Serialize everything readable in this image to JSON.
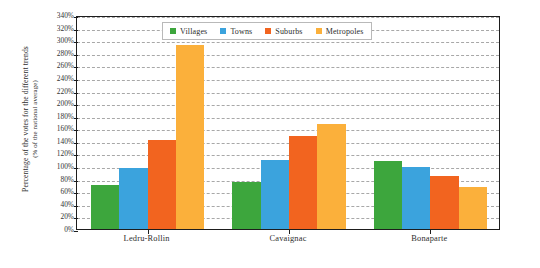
{
  "chart_data": {
    "type": "bar",
    "title": "",
    "subtitle": "",
    "xlabel": "",
    "ylabel": "Percentage of the votes for the different trends",
    "ylabel_line2": "(% of the national average)",
    "categories": [
      "Ledru-Rollin",
      "Cavaignac",
      "Bonaparte"
    ],
    "series": [
      {
        "name": "Villages",
        "color": "#3da63d",
        "values": [
          70,
          75,
          108
        ]
      },
      {
        "name": "Towns",
        "color": "#3ba3dd",
        "values": [
          97,
          110,
          98
        ]
      },
      {
        "name": "Suburbs",
        "color": "#f2641f",
        "values": [
          141,
          147,
          85
        ]
      },
      {
        "name": "Metropoles",
        "color": "#fbb03b",
        "values": [
          293,
          167,
          67
        ]
      }
    ],
    "ylim": [
      0,
      340
    ],
    "ytick_step": 20,
    "ytick_labels": [
      "340%",
      "320%",
      "300%",
      "280%",
      "260%",
      "240%",
      "220%",
      "200%",
      "180%",
      "160%",
      "140%",
      "120%",
      "100%",
      "80%",
      "60%",
      "40%",
      "20%",
      "0%"
    ],
    "grid": true,
    "grid_style": "dashed",
    "grid_color": "#9a9a9a",
    "legend_position": "top-center",
    "axis_color": "#1d1d1d",
    "background": "#ffffff",
    "unit": "%"
  },
  "legend": {
    "entries": [
      {
        "label": "Villages",
        "color": "#3da63d"
      },
      {
        "label": "Towns",
        "color": "#3ba3dd"
      },
      {
        "label": "Suburbs",
        "color": "#f2641f"
      },
      {
        "label": "Metropoles",
        "color": "#fbb03b"
      }
    ]
  }
}
